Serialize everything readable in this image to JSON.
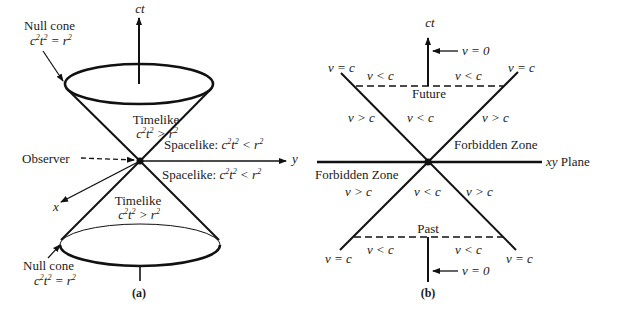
{
  "panel_a": {
    "caption": "(a)",
    "axis_ct": "ct",
    "axis_y": "y",
    "axis_x": "x",
    "observer": "Observer",
    "null_cone_top": {
      "label": "Null cone",
      "eq_lhs": "c",
      "eq_mid": "t",
      "eq_rhs": "= r"
    },
    "null_cone_bottom": {
      "label": "Null cone",
      "eq_lhs": "c",
      "eq_mid": "t",
      "eq_rhs": "= r"
    },
    "timelike_top": {
      "label": "Timelike",
      "eq_lhs": "c",
      "eq_mid": "t",
      "eq_rhs": "> r"
    },
    "timelike_bottom": {
      "label": "Timelike",
      "eq_lhs": "c",
      "eq_mid": "t",
      "eq_rhs": "> r"
    },
    "spacelike_top": {
      "label": "Spacelike:",
      "eq_lhs": "c",
      "eq_mid": "t",
      "eq_rhs": "< r"
    },
    "spacelike_bottom": {
      "label": "Spacelike:",
      "eq_lhs": "c",
      "eq_mid": "t",
      "eq_rhs": "< r"
    },
    "exp": "2"
  },
  "panel_b": {
    "caption": "(b)",
    "axis_ct": "ct",
    "plane": "xy",
    "plane_word": "Plane",
    "future": "Future",
    "past": "Past",
    "forbidden_right": "Forbidden Zone",
    "forbidden_left": "Forbidden Zone",
    "v_eq_0_top": "v = 0",
    "v_eq_0_bottom": "v = 0",
    "v_eq_c": "v = c",
    "v_lt_c": "v < c",
    "v_gt_c": "v > c"
  }
}
